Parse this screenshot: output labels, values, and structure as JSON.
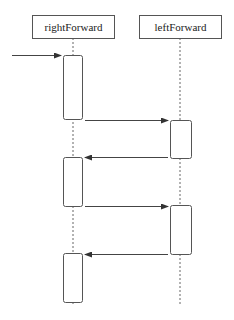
{
  "diagram": {
    "type": "sequence",
    "participants": [
      {
        "id": "rightForward",
        "label": "rightForward",
        "x": 73,
        "box": {
          "x": 32,
          "y": 15,
          "w": 82,
          "h": 23
        }
      },
      {
        "id": "leftForward",
        "label": "leftForward",
        "x": 180,
        "box": {
          "x": 139,
          "y": 15,
          "w": 82,
          "h": 23
        }
      }
    ],
    "activations": [
      {
        "participant": "rightForward",
        "y1": 55,
        "y2": 120
      },
      {
        "participant": "leftForward",
        "y1": 120,
        "y2": 158
      },
      {
        "participant": "rightForward",
        "y1": 157,
        "y2": 207
      },
      {
        "participant": "leftForward",
        "y1": 205,
        "y2": 255
      },
      {
        "participant": "rightForward",
        "y1": 253,
        "y2": 303
      }
    ],
    "messages": [
      {
        "from": "external",
        "to": "rightForward",
        "y": 55,
        "x1": 12,
        "x2": 61,
        "label": ""
      },
      {
        "from": "rightForward",
        "to": "leftForward",
        "y": 120,
        "x1": 85,
        "x2": 168,
        "label": ""
      },
      {
        "from": "leftForward",
        "to": "rightForward",
        "y": 157,
        "x1": 168,
        "x2": 85,
        "label": ""
      },
      {
        "from": "rightForward",
        "to": "leftForward",
        "y": 206,
        "x1": 85,
        "x2": 168,
        "label": ""
      },
      {
        "from": "leftForward",
        "to": "rightForward",
        "y": 254,
        "x1": 168,
        "x2": 85,
        "label": ""
      }
    ],
    "lifeline_end_y": 304
  }
}
